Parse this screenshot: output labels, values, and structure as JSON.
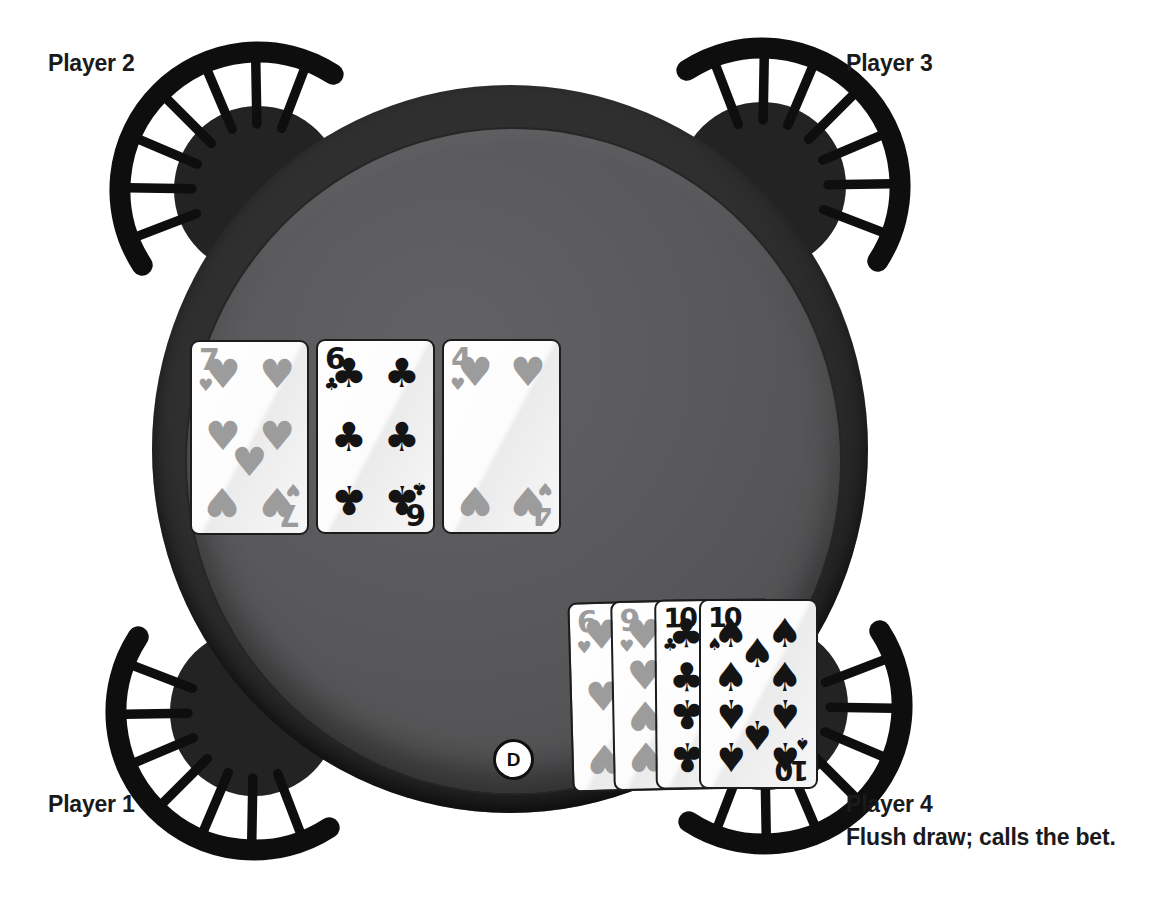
{
  "players": [
    {
      "label": "Player 1",
      "position": "bottom-left",
      "note": ""
    },
    {
      "label": "Player 2",
      "position": "top-left",
      "note": ""
    },
    {
      "label": "Player 3",
      "position": "top-right",
      "note": ""
    },
    {
      "label": "Player 4",
      "position": "bottom-right",
      "note": "Flush draw; calls the bet."
    }
  ],
  "community_cards": [
    {
      "rank": "7",
      "suit": "hearts"
    },
    {
      "rank": "6",
      "suit": "clubs"
    },
    {
      "rank": "4",
      "suit": "hearts"
    }
  ],
  "player4_hand": [
    {
      "rank": "6",
      "suit": "hearts"
    },
    {
      "rank": "9",
      "suit": "hearts"
    },
    {
      "rank": "10",
      "suit": "clubs"
    },
    {
      "rank": "10",
      "suit": "spades"
    }
  ],
  "dealer_button": {
    "label": "D"
  },
  "suit_glyphs": {
    "hearts": "♥",
    "clubs": "♣",
    "spades": "♠"
  },
  "colors": {
    "heart_pip": "#9c9c9c",
    "black_pip": "#141414",
    "felt": "#59595b",
    "rim": "#1e1e1e",
    "card_face": "#ffffff",
    "background": "#ffffff"
  }
}
